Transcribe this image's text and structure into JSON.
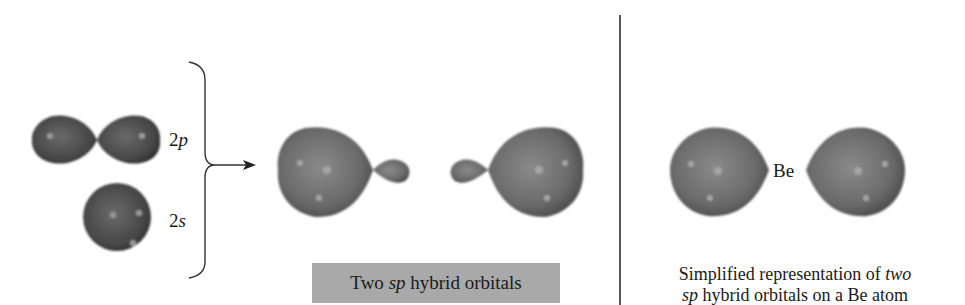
{
  "figure": {
    "left_panel": {
      "orbital_2p": {
        "label_prefix": "2",
        "label_italic": "p"
      },
      "orbital_2s": {
        "label_prefix": "2",
        "label_italic": "s"
      }
    },
    "middle_panel": {
      "caption": {
        "before": "Two ",
        "italic": "sp",
        "after": " hybrid orbitals"
      }
    },
    "right_panel": {
      "atom_label": "Be",
      "caption_line1": {
        "text": "Simplified representation of ",
        "italic": "two"
      },
      "caption_line2": {
        "italic": "sp",
        "text": " hybrid orbitals on a Be atom"
      }
    },
    "colors": {
      "orbital_fill": "#6e6e6e",
      "orbital_dark": "#3f3f3f",
      "caption_box": "#a9a9a9",
      "line": "#333333"
    }
  }
}
